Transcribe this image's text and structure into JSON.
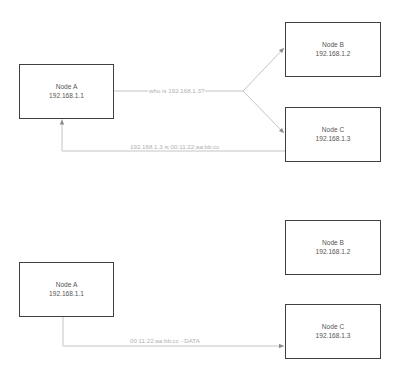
{
  "diagrams": [
    {
      "name": "arp-resolution",
      "nodes": [
        {
          "id": "A",
          "title": "Node A",
          "ip": "192.168.1.1"
        },
        {
          "id": "B",
          "title": "Node B",
          "ip": "192.168.1.2"
        },
        {
          "id": "C",
          "title": "Node C",
          "ip": "192.168.1.3"
        }
      ],
      "edges": [
        {
          "from": "A",
          "to": [
            "B",
            "C"
          ],
          "label": "who is 192.168.1.3?",
          "type": "broadcast"
        },
        {
          "from": "C",
          "to": "A",
          "label": "192.168.1.3 is 00:11:22:aa:bb:cc",
          "type": "reply"
        }
      ]
    },
    {
      "name": "data-transfer",
      "nodes": [
        {
          "id": "A",
          "title": "Node A",
          "ip": "192.168.1.1"
        },
        {
          "id": "B",
          "title": "Node B",
          "ip": "192.168.1.2"
        },
        {
          "id": "C",
          "title": "Node C",
          "ip": "192.168.1.3"
        }
      ],
      "edges": [
        {
          "from": "A",
          "to": "C",
          "label": "00:11:22:aa:bb:cc - DATA",
          "type": "unicast"
        }
      ]
    }
  ],
  "colors": {
    "node_border": "#3f3f3f",
    "node_text": "#555555",
    "edge": "#bdbdbd",
    "edge_label": "#b0b0b0"
  }
}
